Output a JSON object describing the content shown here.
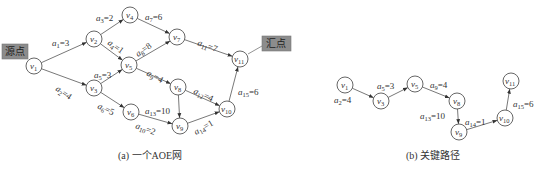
{
  "diagram_a": {
    "caption": "(a) 一个AOE网",
    "source_tag": "源点",
    "sink_tag": "汇点",
    "nodes": [
      {
        "id": "v1",
        "name": "v",
        "sub": "1",
        "x": 34,
        "y": 66
      },
      {
        "id": "v2",
        "name": "v",
        "sub": "2",
        "x": 94,
        "y": 39
      },
      {
        "id": "v3",
        "name": "v",
        "sub": "3",
        "x": 94,
        "y": 88
      },
      {
        "id": "v4",
        "name": "v",
        "sub": "4",
        "x": 130,
        "y": 15
      },
      {
        "id": "v5",
        "name": "v",
        "sub": "5",
        "x": 129,
        "y": 65
      },
      {
        "id": "v6",
        "name": "v",
        "sub": "6",
        "x": 131,
        "y": 112
      },
      {
        "id": "v7",
        "name": "v",
        "sub": "7",
        "x": 177,
        "y": 37
      },
      {
        "id": "v8",
        "name": "v",
        "sub": "8",
        "x": 178,
        "y": 87
      },
      {
        "id": "v9",
        "name": "v",
        "sub": "9",
        "x": 180,
        "y": 126
      },
      {
        "id": "v10",
        "name": "v",
        "sub": "10",
        "x": 227,
        "y": 109
      },
      {
        "id": "v11",
        "name": "v",
        "sub": "11",
        "x": 240,
        "y": 59
      }
    ],
    "edges": [
      {
        "from": "v1",
        "to": "v2",
        "label": "a",
        "sub": "1",
        "weight": "3",
        "lx": 52,
        "ly": 46
      },
      {
        "from": "v1",
        "to": "v3",
        "label": "a",
        "sub": "2",
        "weight": "4",
        "lx": 55,
        "ly": 90,
        "rot": 35
      },
      {
        "from": "v2",
        "to": "v4",
        "label": "a",
        "sub": "3",
        "weight": "2",
        "lx": 96,
        "ly": 21
      },
      {
        "from": "v2",
        "to": "v5",
        "label": "a",
        "sub": "4",
        "weight": "1",
        "lx": 107,
        "ly": 44,
        "rot": 35
      },
      {
        "from": "v3",
        "to": "v5",
        "label": "a",
        "sub": "5",
        "weight": "3",
        "lx": 94,
        "ly": 78
      },
      {
        "from": "v3",
        "to": "v6",
        "label": "a",
        "sub": "6",
        "weight": "5",
        "lx": 97,
        "ly": 108,
        "rot": 25
      },
      {
        "from": "v4",
        "to": "v7",
        "label": "a",
        "sub": "7",
        "weight": "6",
        "lx": 145,
        "ly": 20
      },
      {
        "from": "v5",
        "to": "v7",
        "label": "a",
        "sub": "8",
        "weight": "8",
        "lx": 138,
        "ly": 57,
        "rot": -35
      },
      {
        "from": "v5",
        "to": "v8",
        "label": "a",
        "sub": "9",
        "weight": "4",
        "lx": 146,
        "ly": 75,
        "rot": 28
      },
      {
        "from": "v6",
        "to": "v9",
        "label": "a",
        "sub": "10",
        "weight": "2",
        "lx": 135,
        "ly": 128,
        "rot": 20
      },
      {
        "from": "v7",
        "to": "v11",
        "label": "a",
        "sub": "11",
        "weight": "7",
        "lx": 197,
        "ly": 45,
        "rot": 20
      },
      {
        "from": "v8",
        "to": "v10",
        "label": "a",
        "sub": "12",
        "weight": "4",
        "lx": 193,
        "ly": 93,
        "rot": 25
      },
      {
        "from": "v8",
        "to": "v9",
        "label": "a",
        "sub": "13",
        "weight": "10",
        "lx": 145,
        "ly": 114
      },
      {
        "from": "v9",
        "to": "v10",
        "label": "a",
        "sub": "14",
        "weight": "1",
        "lx": 196,
        "ly": 135,
        "rot": -30
      },
      {
        "from": "v10",
        "to": "v11",
        "label": "a",
        "sub": "15",
        "weight": "6",
        "lx": 238,
        "ly": 95
      }
    ]
  },
  "diagram_b": {
    "caption": "(b) 关键路径",
    "nodes": [
      {
        "id": "v1",
        "name": "v",
        "sub": "1",
        "x": 345,
        "y": 85
      },
      {
        "id": "v3",
        "name": "v",
        "sub": "3",
        "x": 381,
        "y": 101
      },
      {
        "id": "v5",
        "name": "v",
        "sub": "5",
        "x": 415,
        "y": 84
      },
      {
        "id": "v8",
        "name": "v",
        "sub": "8",
        "x": 457,
        "y": 101
      },
      {
        "id": "v9",
        "name": "v",
        "sub": "9",
        "x": 459,
        "y": 132
      },
      {
        "id": "v10",
        "name": "v",
        "sub": "10",
        "x": 505,
        "y": 118
      },
      {
        "id": "v11",
        "name": "v",
        "sub": "11",
        "x": 511,
        "y": 81
      }
    ],
    "edges": [
      {
        "from": "v1",
        "to": "v3",
        "label": "a",
        "sub": "2",
        "weight": "4",
        "lx": 334,
        "ly": 103
      },
      {
        "from": "v3",
        "to": "v5",
        "label": "a",
        "sub": "5",
        "weight": "3",
        "lx": 377,
        "ly": 89
      },
      {
        "from": "v5",
        "to": "v8",
        "label": "a",
        "sub": "9",
        "weight": "4",
        "lx": 430,
        "ly": 88
      },
      {
        "from": "v8",
        "to": "v9",
        "label": "a",
        "sub": "13",
        "weight": "10",
        "lx": 420,
        "ly": 119
      },
      {
        "from": "v9",
        "to": "v10",
        "label": "a",
        "sub": "14",
        "weight": "1",
        "lx": 465,
        "ly": 125
      },
      {
        "from": "v10",
        "to": "v11",
        "label": "a",
        "sub": "15",
        "weight": "6",
        "lx": 513,
        "ly": 107
      }
    ]
  }
}
